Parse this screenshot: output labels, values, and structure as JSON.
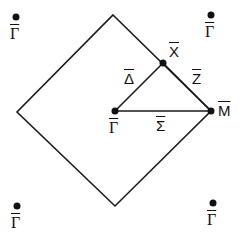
{
  "diagram": {
    "type": "brillouin-zone",
    "line_color": "#1a1a1a",
    "zone_boundary": [
      [
        113,
        15
      ],
      [
        211,
        111
      ],
      [
        115,
        206
      ],
      [
        17,
        112
      ]
    ],
    "path_lines": [
      {
        "from": "Gamma_center",
        "to": "X"
      },
      {
        "from": "X",
        "to": "M"
      },
      {
        "from": "Gamma_center",
        "to": "M"
      }
    ],
    "points": {
      "Gamma_center": {
        "label": "Γ",
        "x": 115,
        "y": 111
      },
      "X": {
        "label": "X",
        "x": 163,
        "y": 63
      },
      "M": {
        "label": "M",
        "x": 211,
        "y": 111
      },
      "Gamma_tl": {
        "label": "Γ",
        "x": 16,
        "y": 17
      },
      "Gamma_tr": {
        "label": "Γ",
        "x": 211,
        "y": 15
      },
      "Gamma_bl": {
        "label": "Γ",
        "x": 17,
        "y": 206
      },
      "Gamma_br": {
        "label": "Γ",
        "x": 213,
        "y": 203
      }
    },
    "line_labels": {
      "Delta": "Δ",
      "Z": "Z",
      "Sigma": "Σ"
    }
  }
}
